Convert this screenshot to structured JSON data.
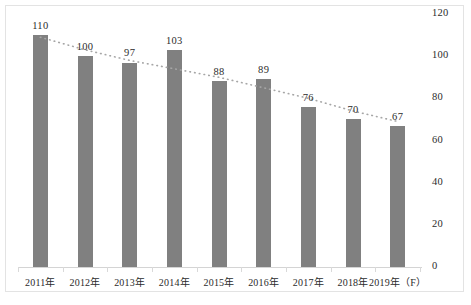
{
  "chart_data": {
    "type": "bar",
    "title": "",
    "subtitle": "",
    "xlabel": "",
    "ylabel": "",
    "categories": [
      "2011年",
      "2012年",
      "2013年",
      "2014年",
      "2015年",
      "2016年",
      "2017年",
      "2018年",
      "2019年（F）"
    ],
    "values": [
      110,
      100,
      97,
      103,
      88,
      89,
      76,
      70,
      67
    ],
    "data_labels": [
      "110",
      "100",
      "97",
      "103",
      "88",
      "89",
      "76",
      "70",
      "67"
    ],
    "ylim": [
      0,
      120
    ],
    "ytick_values": [
      0,
      20,
      40,
      60,
      80,
      100,
      120
    ],
    "ytick_labels": [
      "0",
      "20",
      "40",
      "60",
      "80",
      "100",
      "120"
    ],
    "yaxis_position": "right",
    "grid": false,
    "legend": "none",
    "series": [
      {
        "name": "bars",
        "type": "bar",
        "color": "#808080",
        "values": [
          110,
          100,
          97,
          103,
          88,
          89,
          76,
          70,
          67
        ]
      },
      {
        "name": "trendline",
        "type": "line",
        "style": "dotted",
        "color": "#a6a6a6",
        "values": [
          109,
          103,
          98,
          94,
          90,
          85,
          80,
          74,
          69
        ]
      }
    ],
    "annotations": []
  },
  "colors": {
    "bar": "#808080",
    "trendline": "#a6a6a6",
    "axis": "#d4d4d4",
    "frame": "#e3e3e3",
    "text": "#2b2b2b",
    "background": "#ffffff"
  }
}
